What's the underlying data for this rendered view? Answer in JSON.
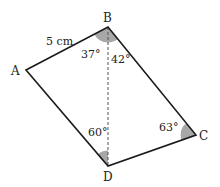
{
  "diagram": {
    "vertices": [
      {
        "id": "A",
        "label": "A",
        "x": 26,
        "y": 70
      },
      {
        "id": "B",
        "label": "B",
        "x": 108,
        "y": 27
      },
      {
        "id": "C",
        "label": "C",
        "x": 196,
        "y": 135
      },
      {
        "id": "D",
        "label": "D",
        "x": 108,
        "y": 166
      }
    ],
    "edges": [
      [
        "A",
        "B"
      ],
      [
        "B",
        "C"
      ],
      [
        "C",
        "D"
      ],
      [
        "D",
        "A"
      ]
    ],
    "diagonal": {
      "from": "B",
      "to": "D",
      "style": "dashed"
    },
    "side_label": {
      "edge": "AB",
      "text": "5 cm"
    },
    "angles": [
      {
        "at": "B",
        "between": "AB-BD",
        "label": "37°"
      },
      {
        "at": "B",
        "between": "DB-BC",
        "label": "42°"
      },
      {
        "at": "D",
        "between": "AD-DB",
        "label": "60°"
      },
      {
        "at": "C",
        "between": "BC-CD",
        "label": "63°"
      }
    ],
    "colors": {
      "line": "#1a1a1a",
      "angle_fill": "#a8a8a8",
      "dashed": "#555555"
    }
  }
}
